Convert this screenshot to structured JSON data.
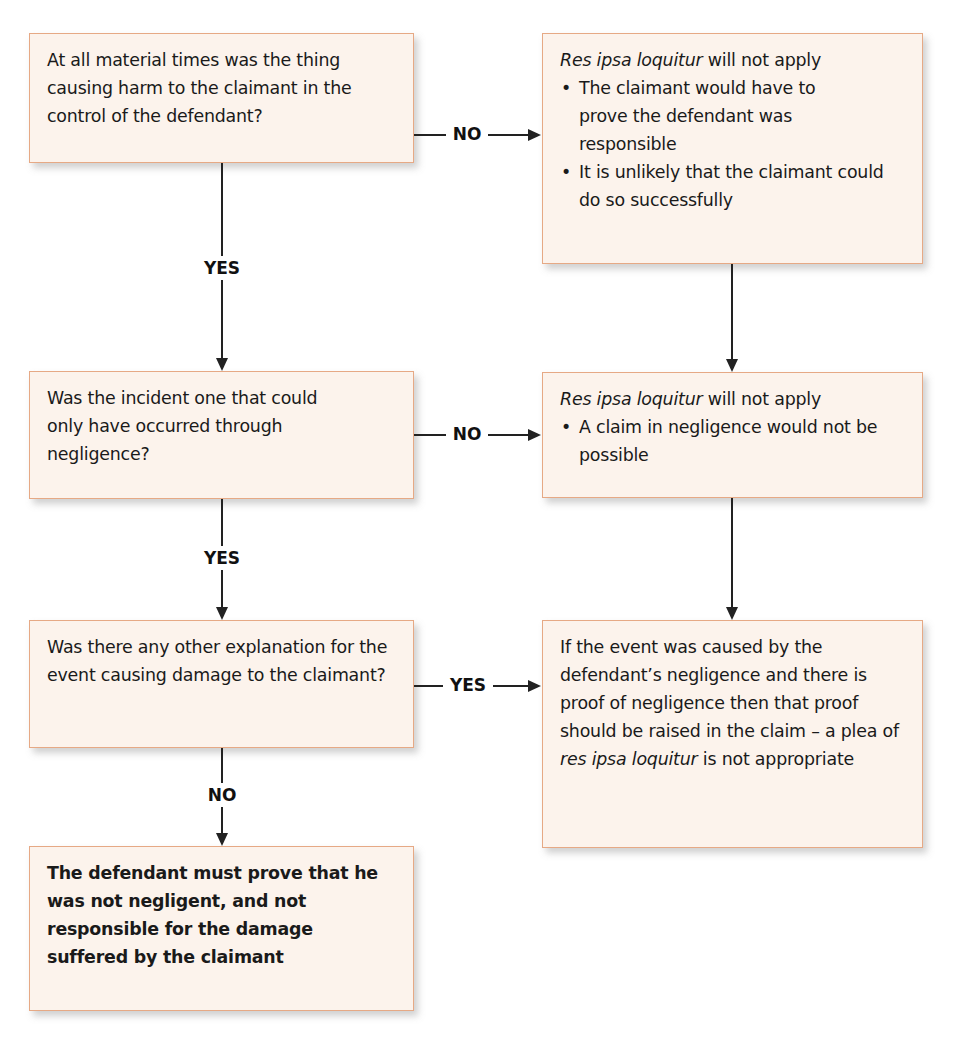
{
  "flowchart": {
    "title": "Res ipsa loquitur decision flowchart",
    "colors": {
      "box_fill": "#fcf3ec",
      "box_border": "#e6a985",
      "arrow": "#222222"
    },
    "questions": [
      {
        "id": "q1",
        "text": "At all material times was the thing causing harm to the claimant in the control of the defendant?"
      },
      {
        "id": "q2",
        "text": "Was the incident one that could only have occurred through negligence?"
      },
      {
        "id": "q3",
        "text": "Was there any other explanation for the event causing damage to the claimant?"
      }
    ],
    "outcomes": [
      {
        "id": "o1",
        "heading_italic": "Res ipsa loquitur",
        "heading_rest": " will not apply",
        "bullets": [
          "The claimant would have to prove the defendant was responsible",
          "It is unlikely that the claimant could do so successfully"
        ]
      },
      {
        "id": "o2",
        "heading_italic": "Res ipsa loquitur",
        "heading_rest": " will not apply",
        "bullets": [
          "A claim in negligence would not be possible"
        ]
      },
      {
        "id": "o3",
        "text_before": "If the event was caused by the defendant’s negligence and there is proof of negligence then that proof should be raised in the claim – a plea of ",
        "text_italic": "res ipsa loquitur",
        "text_after": " is not appropriate"
      },
      {
        "id": "final",
        "text": "The defendant must prove that he was not negligent, and not responsible for the damage suffered by the claimant"
      }
    ],
    "edge_labels": {
      "q1_no": "NO",
      "q1_yes": "YES",
      "q2_no": "NO",
      "q2_yes": "YES",
      "q3_yes": "YES",
      "q3_no": "NO"
    }
  }
}
